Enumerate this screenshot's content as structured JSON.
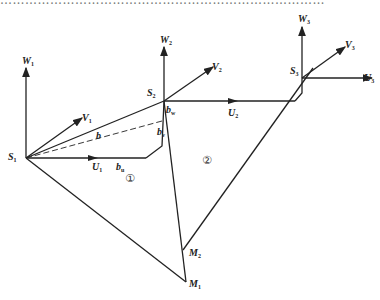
{
  "caption_strip": {
    "text": "……………………………………………………………………",
    "note": "cropped illegible text line"
  },
  "diagram": {
    "stations": [
      {
        "id": "S1",
        "label": "S",
        "sub": "1",
        "x": 26,
        "y": 158
      },
      {
        "id": "S2",
        "label": "S",
        "sub": "2",
        "x": 164,
        "y": 101
      },
      {
        "id": "S3",
        "label": "S",
        "sub": "3",
        "x": 302,
        "y": 78
      }
    ],
    "axes": {
      "S1": {
        "W": "W",
        "W_sub": "1",
        "V": "V",
        "V_sub": "1",
        "U": "U",
        "U_sub": "1"
      },
      "S2": {
        "W": "W",
        "W_sub": "2",
        "V": "V",
        "V_sub": "2",
        "U": "U",
        "U_sub": "2"
      },
      "S3": {
        "W": "W",
        "W_sub": "3",
        "V": "V",
        "V_sub": "3",
        "U": "U",
        "U_sub": "3"
      }
    },
    "baseline_labels": {
      "b": "b",
      "bu": {
        "main": "b",
        "sub": "u"
      },
      "bv": {
        "main": "b",
        "sub": "v"
      },
      "bw": {
        "main": "b",
        "sub": "w"
      }
    },
    "points": [
      {
        "id": "M1",
        "label": "M",
        "sub": "1",
        "x": 186,
        "y": 282
      },
      {
        "id": "M2",
        "label": "M",
        "sub": "2",
        "x": 183,
        "y": 250
      }
    ],
    "regions": [
      {
        "id": "1",
        "label": "①",
        "x": 125,
        "y": 180
      },
      {
        "id": "2",
        "label": "②",
        "x": 208,
        "y": 162
      }
    ],
    "line_color": "#222222"
  }
}
